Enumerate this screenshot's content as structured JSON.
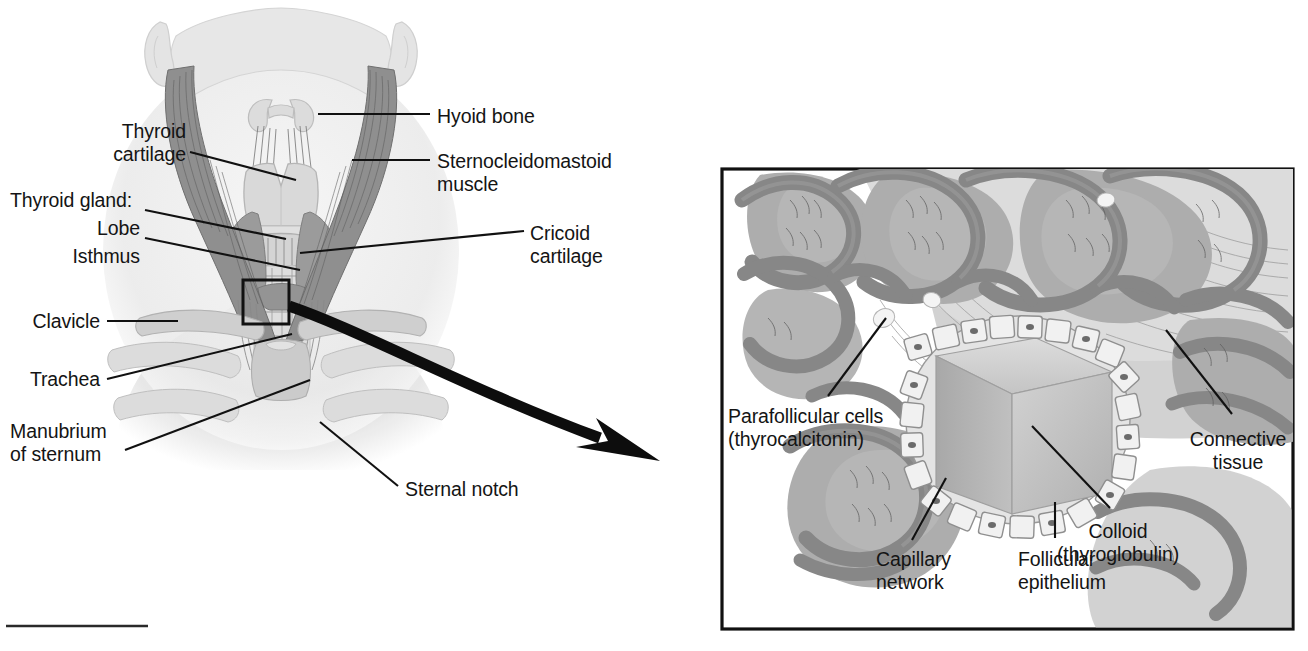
{
  "figure": {
    "background_color": "#ffffff",
    "ink_color": "#141414"
  },
  "left_panel": {
    "name": "anterior-neck-illustration",
    "description": "Anterior view of the neck showing the thyroid gland in relation to the larynx, trachea and surrounding structures",
    "labels": [
      {
        "id": "thyroid-cartilage",
        "text": "Thyroid\ncartilage",
        "align": "right",
        "x": 172,
        "y": 120
      },
      {
        "id": "thyroid-gland-heading",
        "text": "Thyroid gland:",
        "align": "left",
        "x": 10,
        "y": 189
      },
      {
        "id": "lobe",
        "text": "Lobe",
        "align": "right",
        "x": 137,
        "y": 217
      },
      {
        "id": "isthmus",
        "text": "Isthmus",
        "align": "right",
        "x": 137,
        "y": 245
      },
      {
        "id": "clavicle",
        "text": "Clavicle",
        "align": "right",
        "x": 97,
        "y": 310
      },
      {
        "id": "trachea",
        "text": "Trachea",
        "align": "right",
        "x": 97,
        "y": 368
      },
      {
        "id": "manubrium-of-sternum",
        "text": "Manubrium\nof sternum",
        "align": "left",
        "x": 10,
        "y": 420
      },
      {
        "id": "hyoid-bone",
        "text": "Hyoid bone",
        "align": "left",
        "x": 437,
        "y": 105
      },
      {
        "id": "sternocleidomastoid-muscle",
        "text": "Sternocleidomastoid\nmuscle",
        "align": "left",
        "x": 437,
        "y": 150
      },
      {
        "id": "cricoid-cartilage",
        "text": "Cricoid\ncartilage",
        "align": "left",
        "x": 530,
        "y": 222
      },
      {
        "id": "sternal-notch",
        "text": "Sternal notch",
        "align": "left",
        "x": 405,
        "y": 478
      }
    ]
  },
  "right_panel": {
    "name": "thyroid-histology-inset",
    "description": "Magnified histological view of thyroid follicles, colloid and capillary network",
    "border_color": "#141414",
    "labels": [
      {
        "id": "parafollicular-cells",
        "text": "Parafollicular cells\n(thyrocalcitonin)",
        "align": "left",
        "x": 728,
        "y": 405
      },
      {
        "id": "capillary-network",
        "text": "Capillary\nnetwork",
        "align": "left",
        "x": 876,
        "y": 548
      },
      {
        "id": "follicular-epithelium",
        "text": "Follicular\nepithelium",
        "align": "left",
        "x": 1018,
        "y": 548
      },
      {
        "id": "connective-tissue",
        "text": "Connective\ntissue",
        "align": "center",
        "x": 1238,
        "y": 428
      },
      {
        "id": "colloid-thyroglobulin",
        "text": "Colloid\n(thyroglobulin)",
        "align": "center",
        "x": 1118,
        "y": 520
      }
    ]
  },
  "connector_arrow": {
    "name": "magnification-arrow",
    "description": "Thick curved black arrow leading from the boxed region on the neck illustration to the magnified inset"
  },
  "footer_rule": {
    "name": "footer-rule",
    "description": "Short horizontal rule at lower left of the page"
  },
  "palette": {
    "ink": "#141414",
    "skin_pale": "#e9e9e9",
    "skin_shadow": "#dcdcdc",
    "muscle_dark": "#8f8f8f",
    "muscle_mid": "#a6a6a6",
    "cartilage": "#d5d5d5",
    "thyroid_gland": "#9a9a9a",
    "capillary_dark": "#8a8a8a",
    "follicle_mid": "#adadad",
    "connective_light": "#d8d8d8",
    "colloid_light": "#cccccc",
    "colloid_shadow": "#b4b4b4",
    "epithelium": "#efefef"
  }
}
